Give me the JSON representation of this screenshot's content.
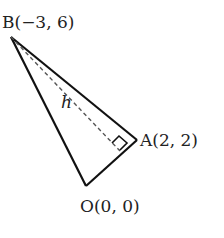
{
  "diagram": {
    "points": {
      "B": {
        "label": "B(−3, 6)",
        "x": -3,
        "y": 6
      },
      "A": {
        "label": "A(2, 2)",
        "x": 2,
        "y": 2
      },
      "O": {
        "label": "O(0, 0)",
        "x": 0,
        "y": 0
      }
    },
    "height_label": "h",
    "colors": {
      "line": "#111111",
      "dash": "#555555",
      "text": "#222222"
    }
  }
}
